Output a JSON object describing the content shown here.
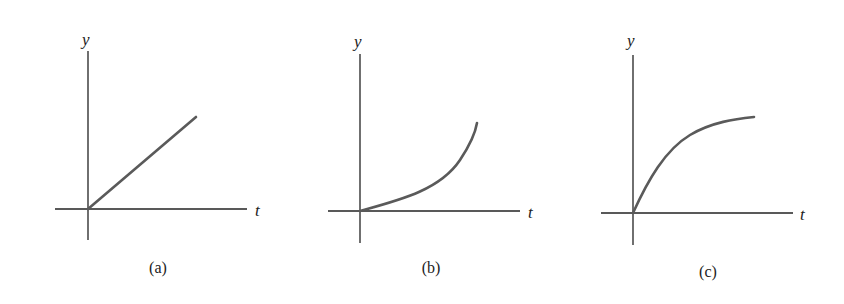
{
  "figure": {
    "panels": [
      {
        "id": "a",
        "caption": "(a)",
        "x_axis_label": "t",
        "y_axis_label": "y",
        "curve_shape": "linear"
      },
      {
        "id": "b",
        "caption": "(b)",
        "x_axis_label": "t",
        "y_axis_label": "y",
        "curve_shape": "exponential-growth (concave up)"
      },
      {
        "id": "c",
        "caption": "(c)",
        "x_axis_label": "t",
        "y_axis_label": "y",
        "curve_shape": "saturating growth (concave down)"
      }
    ],
    "colors": {
      "axis": "#222222",
      "curve": "#5a5a5a",
      "background": "#ffffff"
    }
  }
}
